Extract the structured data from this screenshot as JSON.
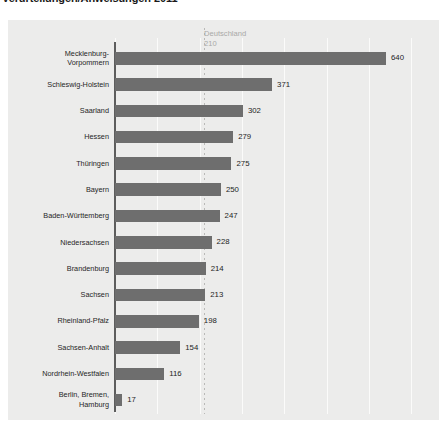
{
  "title": "Verurteilungen/Anweisungen 2011",
  "reference": {
    "name": "Deutschland",
    "value": "210"
  },
  "chart_data": {
    "type": "bar",
    "orientation": "horizontal",
    "title": "Verurteilungen/Anweisungen 2011",
    "xlabel": "",
    "ylabel": "",
    "xlim": [
      0,
      700
    ],
    "grid": true,
    "gridlines": [
      0,
      100,
      200,
      300,
      400,
      500,
      600,
      700
    ],
    "legend": "none",
    "reference_line": {
      "label": "Deutschland",
      "value": 210
    },
    "categories": [
      "Mecklenburg-Vorpommern",
      "Schleswig-Holstein",
      "Saarland",
      "Hessen",
      "Thüringen",
      "Bayern",
      "Baden-Württemberg",
      "Niedersachsen",
      "Brandenburg",
      "Sachsen",
      "Rheinland-Pfalz",
      "Sachsen-Anhalt",
      "Nordrhein-Westfalen",
      "Berlin, Bremen, Hamburg"
    ],
    "values": [
      640,
      371,
      302,
      279,
      275,
      250,
      247,
      228,
      214,
      213,
      198,
      154,
      116,
      17
    ]
  },
  "rows": [
    {
      "label": "Mecklenburg-\nVorpommern",
      "lines": 2,
      "value": "640",
      "num": 640
    },
    {
      "label": "Schleswig-Holstein",
      "lines": 1,
      "value": "371",
      "num": 371
    },
    {
      "label": "Saarland",
      "lines": 1,
      "value": "302",
      "num": 302
    },
    {
      "label": "Hessen",
      "lines": 1,
      "value": "279",
      "num": 279
    },
    {
      "label": "Thüringen",
      "lines": 1,
      "value": "275",
      "num": 275
    },
    {
      "label": "Bayern",
      "lines": 1,
      "value": "250",
      "num": 250
    },
    {
      "label": "Baden-Württemberg",
      "lines": 1,
      "value": "247",
      "num": 247
    },
    {
      "label": "Niedersachsen",
      "lines": 1,
      "value": "228",
      "num": 228
    },
    {
      "label": "Brandenburg",
      "lines": 1,
      "value": "214",
      "num": 214
    },
    {
      "label": "Sachsen",
      "lines": 1,
      "value": "213",
      "num": 213
    },
    {
      "label": "Rheinland-Pfalz",
      "lines": 1,
      "value": "198",
      "num": 198
    },
    {
      "label": "Sachsen-Anhalt",
      "lines": 1,
      "value": "154",
      "num": 154
    },
    {
      "label": "Nordrhein-Westfalen",
      "lines": 1,
      "value": "116",
      "num": 116
    },
    {
      "label": "Berlin, Bremen,\nHamburg",
      "lines": 2,
      "value": "17",
      "num": 17
    }
  ],
  "colors": {
    "bar": "#6e6e6e",
    "panel": "#ececeb",
    "grid": "#fbfbfa",
    "axis": "#5d5d5d",
    "reference_text": "#a9a9a7"
  }
}
